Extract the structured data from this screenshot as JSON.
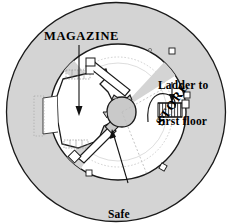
{
  "figure": {
    "kind": "architectural-floor-plan",
    "shape": "circular",
    "labels": {
      "magazine": "MAGAZINE",
      "ladder_line1": "Ladder to",
      "ladder_line2": "first floor",
      "store": "STORE",
      "safe_line1": "Safe",
      "safe_line2": "Lantern"
    },
    "colors": {
      "outer_fill": "#d4d4d4",
      "inner_fill": "#ffffff",
      "shaft_fill": "#c9c9c9",
      "stroke": "#000000",
      "hatch": "#8a8a8a",
      "faint": "#b4b4b4",
      "background": "#ffffff"
    },
    "geometry": {
      "outer_circle": {
        "cx": 116,
        "cy": 112,
        "r": 110
      },
      "inner_circle": {
        "cx": 118,
        "cy": 112,
        "r": 68
      },
      "shaft_circle": {
        "cx": 122,
        "cy": 112,
        "r": 15
      }
    },
    "annotations": [
      {
        "name": "magazine",
        "arrow": "down"
      },
      {
        "name": "ladder-to-first-floor",
        "arrow": "down"
      },
      {
        "name": "store",
        "arrow": "none"
      },
      {
        "name": "safe-lantern",
        "arrow": "up-left"
      }
    ]
  }
}
